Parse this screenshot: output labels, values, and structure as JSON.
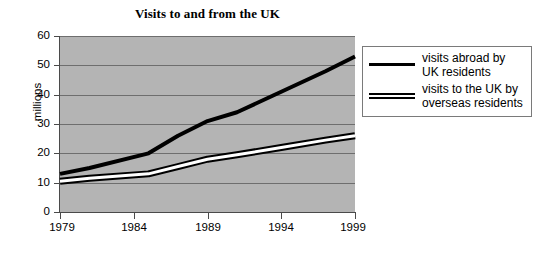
{
  "chart_data": {
    "type": "line",
    "title": "Visits to and from the UK",
    "xlabel": "",
    "ylabel": "millions",
    "xlim": [
      1979,
      1999
    ],
    "ylim": [
      0,
      60
    ],
    "ytick_labels": [
      "60",
      "50",
      "40",
      "30",
      "20",
      "10",
      "0"
    ],
    "yticks": [
      60,
      50,
      40,
      30,
      20,
      10,
      0
    ],
    "xtick_labels": [
      "1979",
      "1984",
      "1989",
      "1994",
      "1999"
    ],
    "xticks": [
      1979,
      1984,
      1989,
      1994,
      1999
    ],
    "grid": "horizontal",
    "plot_background": "#b4b4b4",
    "legend_position": "right-outside",
    "series": [
      {
        "name": "visits abroad by UK residents",
        "style": "single-thick-line",
        "color": "#000000",
        "x": [
          1979,
          1981,
          1985,
          1987,
          1989,
          1991,
          1994,
          1997,
          1999
        ],
        "values": [
          13,
          15,
          20,
          26,
          31,
          34,
          41,
          48,
          53
        ]
      },
      {
        "name": "visits to the UK by overseas residents",
        "style": "double-line",
        "color": "#000000",
        "x": [
          1979,
          1981,
          1985,
          1987,
          1989,
          1991,
          1994,
          1997,
          1999
        ],
        "values": [
          10.5,
          11.5,
          13,
          15.5,
          18,
          19.5,
          22,
          24.5,
          26
        ]
      }
    ]
  },
  "legend": {
    "entries": [
      {
        "line1": "visits abroad by",
        "line2": "UK residents"
      },
      {
        "line1": "visits to the UK by",
        "line2": "overseas residents"
      }
    ]
  }
}
